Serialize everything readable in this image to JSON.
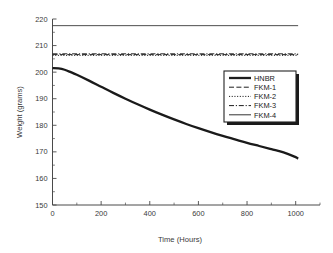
{
  "chart_data": {
    "type": "line",
    "title": "",
    "xlabel": "Time (Hours)",
    "ylabel": "Weight (grams)",
    "xlim": [
      0,
      1100
    ],
    "ylim": [
      150,
      220
    ],
    "xticks": [
      0,
      200,
      400,
      600,
      800,
      1000
    ],
    "yticks": [
      150,
      160,
      170,
      180,
      190,
      200,
      210,
      220
    ],
    "xtick_labels": [
      "0",
      "200",
      "400",
      "600",
      "800",
      "1000"
    ],
    "ytick_labels": [
      "150",
      "160",
      "170",
      "180",
      "190",
      "200",
      "210",
      "220"
    ],
    "grid": false,
    "legend_position": "center-right",
    "series": [
      {
        "name": "HNBR",
        "style": "solid-thick",
        "color": "#1a1a1a",
        "x": [
          0,
          25,
          50,
          75,
          100,
          150,
          200,
          250,
          300,
          350,
          400,
          450,
          500,
          550,
          600,
          650,
          700,
          750,
          800,
          850,
          900,
          950,
          1000,
          1010
        ],
        "y": [
          201.5,
          201.4,
          200.9,
          200.0,
          199.0,
          196.8,
          194.5,
          192.2,
          190.0,
          187.9,
          185.9,
          184.0,
          182.2,
          180.5,
          178.9,
          177.4,
          176.0,
          174.7,
          173.4,
          172.2,
          171.0,
          169.8,
          168.0,
          167.4
        ]
      },
      {
        "name": "FKM-1",
        "style": "dashed",
        "color": "#2a2a2a",
        "x": [
          0,
          1010
        ],
        "y": [
          206.6,
          206.6
        ]
      },
      {
        "name": "FKM-2",
        "style": "dotted",
        "color": "#2a2a2a",
        "x": [
          0,
          1010
        ],
        "y": [
          206.3,
          206.3
        ]
      },
      {
        "name": "FKM-3",
        "style": "dash-dot",
        "color": "#2a2a2a",
        "x": [
          0,
          1010
        ],
        "y": [
          206.9,
          206.9
        ]
      },
      {
        "name": "FKM-4",
        "style": "solid-thin",
        "color": "#3a3a3a",
        "x": [
          0,
          1010
        ],
        "y": [
          217.5,
          217.5
        ]
      }
    ],
    "legend_entries": [
      {
        "label": "HNBR",
        "style": "solid-thick"
      },
      {
        "label": "FKM-1",
        "style": "dashed"
      },
      {
        "label": "FKM-2",
        "style": "dotted"
      },
      {
        "label": "FKM-3",
        "style": "dash-dot"
      },
      {
        "label": "FKM-4",
        "style": "solid-thin"
      }
    ]
  }
}
